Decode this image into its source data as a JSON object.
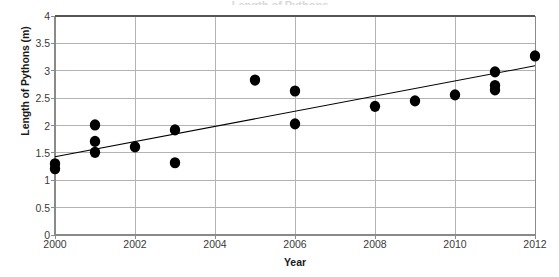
{
  "chart_data": {
    "type": "scatter",
    "title": "",
    "xlabel": "Year",
    "ylabel": "Length of Pythons (m)",
    "xlim": [
      2000,
      2012
    ],
    "ylim": [
      0,
      4
    ],
    "xticks": [
      "2000",
      "2002",
      "2004",
      "2006",
      "2008",
      "2010",
      "2012"
    ],
    "xtick_values": [
      2000,
      2002,
      2004,
      2006,
      2008,
      2010,
      2012
    ],
    "yticks": [
      "0",
      "0.5",
      "1",
      "1.5",
      "2",
      "2.5",
      "3",
      "3.5",
      "4"
    ],
    "ytick_values": [
      0,
      0.5,
      1,
      1.5,
      2,
      2.5,
      3,
      3.5,
      4
    ],
    "grid": "horizontal-and-vertical",
    "legend": "none",
    "marker_color": "#000000",
    "line_color": "#000000",
    "grid_color": "#b3b3b3",
    "points": [
      {
        "x": 2000,
        "y": 1.3
      },
      {
        "x": 2000,
        "y": 1.21
      },
      {
        "x": 2001,
        "y": 2.01
      },
      {
        "x": 2001,
        "y": 1.71
      },
      {
        "x": 2001,
        "y": 1.51
      },
      {
        "x": 2002,
        "y": 1.61
      },
      {
        "x": 2003,
        "y": 1.92
      },
      {
        "x": 2003,
        "y": 1.32
      },
      {
        "x": 2005,
        "y": 2.83
      },
      {
        "x": 2006,
        "y": 2.63
      },
      {
        "x": 2006,
        "y": 2.03
      },
      {
        "x": 2008,
        "y": 2.35
      },
      {
        "x": 2009,
        "y": 2.45
      },
      {
        "x": 2010,
        "y": 2.56
      },
      {
        "x": 2011,
        "y": 2.98
      },
      {
        "x": 2011,
        "y": 2.73
      },
      {
        "x": 2011,
        "y": 2.65
      },
      {
        "x": 2012,
        "y": 3.27
      }
    ],
    "trendline": {
      "x0": 2000,
      "y0": 1.43,
      "x1": 2012,
      "y1": 3.09
    }
  },
  "title_remnant": "Length of Pythons"
}
